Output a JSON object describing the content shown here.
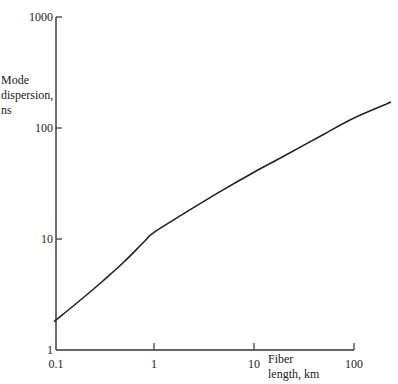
{
  "chart_data": {
    "type": "line",
    "title": "",
    "xlabel": "Fiber length, km",
    "ylabel": "Mode dispersion, ns",
    "xscale": "log",
    "yscale": "log",
    "xlim": [
      0.1,
      100
    ],
    "ylim": [
      1,
      1000
    ],
    "x_ticks": [
      "0.1",
      "1",
      "10",
      "100"
    ],
    "y_ticks": [
      "1",
      "10",
      "100",
      "1000"
    ],
    "grid": false,
    "legend": null,
    "series": [
      {
        "name": "Mode dispersion",
        "x": [
          0.1,
          0.2,
          0.3,
          0.5,
          0.8,
          1,
          2,
          5,
          10,
          20,
          50,
          100,
          235
        ],
        "y": [
          1.8,
          3.0,
          4.1,
          6.2,
          9.5,
          11.5,
          17,
          28,
          40,
          56,
          88,
          123,
          171
        ]
      }
    ]
  },
  "labels": {
    "ylabel_lines": [
      "Mode",
      "dispersion,",
      "ns"
    ],
    "xlabel_lines": [
      "Fiber",
      "length, km"
    ]
  }
}
